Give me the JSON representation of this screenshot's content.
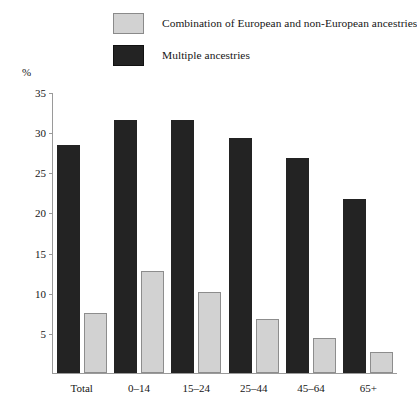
{
  "chart_data": {
    "type": "bar",
    "title": "",
    "subtitle": "",
    "xlabel": "",
    "ylabel": "%",
    "ylim": [
      0,
      35
    ],
    "ytick_step": 5,
    "yticks": [
      "35",
      "30",
      "25",
      "20",
      "15",
      "10",
      "5"
    ],
    "grid": false,
    "legend_position": "top",
    "categories": [
      "Total",
      "0–14",
      "15–24",
      "25–44",
      "45–64",
      "65+"
    ],
    "series": [
      {
        "name": "Combination of European and non-European ancestries",
        "color": "#d2d2d2",
        "values": [
          7.5,
          12.7,
          10.1,
          6.7,
          4.4,
          2.6
        ]
      },
      {
        "name": "Multiple ancestries",
        "color": "#232323",
        "values": [
          28.4,
          31.5,
          31.5,
          29.3,
          26.8,
          21.7
        ]
      }
    ]
  },
  "legend": {
    "items": [
      {
        "label": "Combination of European and non-European ancestries",
        "swatch": "light"
      },
      {
        "label": "Multiple ancestries",
        "swatch": "dark"
      }
    ]
  },
  "axis": {
    "unit": "%"
  }
}
